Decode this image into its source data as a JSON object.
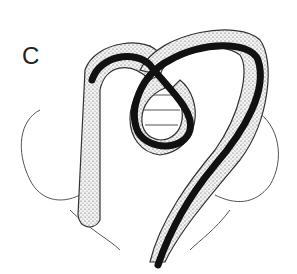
{
  "figure": {
    "panel_label": "C",
    "colors": {
      "ink": "#111111",
      "stipple_fill": "#d8d8d8",
      "outline": "#333333",
      "background": "#ffffff"
    }
  }
}
